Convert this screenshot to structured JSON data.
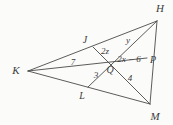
{
  "figure": {
    "type": "triangle-with-medians",
    "background_color": "#fbfbfa",
    "stroke_color": "#4a4a4a",
    "label_color": "#3b3b3b",
    "width": 173,
    "height": 125,
    "vertices": [
      {
        "name": "H",
        "label": "H",
        "x": 157,
        "y": 21,
        "label_x": 160,
        "label_y": 8
      },
      {
        "name": "K",
        "label": "K",
        "x": 28,
        "y": 71,
        "label_x": 16,
        "label_y": 70
      },
      {
        "name": "M",
        "label": "M",
        "x": 150,
        "y": 104,
        "label_x": 155,
        "label_y": 116
      }
    ],
    "points": [
      {
        "name": "J",
        "label": "J",
        "x": 93,
        "y": 47,
        "label_x": 85,
        "label_y": 40
      },
      {
        "name": "L",
        "label": "L",
        "x": 88,
        "y": 87,
        "label_x": 82,
        "label_y": 96
      },
      {
        "name": "P",
        "label": "P",
        "x": 147,
        "y": 58,
        "label_x": 153,
        "label_y": 60
      },
      {
        "name": "Q",
        "label": "Q",
        "x": 110,
        "y": 62,
        "label_x": 110,
        "label_y": 70
      }
    ],
    "segment_labels": [
      {
        "name": "KQ-length",
        "label": "7",
        "x": 73,
        "y": 62
      },
      {
        "name": "QL-length",
        "label": "3",
        "x": 96,
        "y": 75
      },
      {
        "name": "QM-length",
        "label": "4",
        "x": 130,
        "y": 78
      },
      {
        "name": "JQ-length",
        "label": "2z",
        "x": 105,
        "y": 51
      },
      {
        "name": "QH-length",
        "label": "y",
        "x": 128,
        "y": 40
      },
      {
        "name": "QP-length",
        "label": "2x − 6",
        "x": 129,
        "y": 59
      }
    ],
    "edges": [
      {
        "name": "edge-KH",
        "from": "K",
        "to": "H"
      },
      {
        "name": "edge-KM",
        "from": "K",
        "to": "M"
      },
      {
        "name": "edge-HM",
        "from": "H",
        "to": "M"
      }
    ],
    "medians": [
      {
        "name": "median-KP",
        "from": "K",
        "to": "P"
      },
      {
        "name": "median-HL",
        "from": "H",
        "to": "L"
      },
      {
        "name": "median-MJ",
        "from": "M",
        "to": "J"
      }
    ]
  }
}
